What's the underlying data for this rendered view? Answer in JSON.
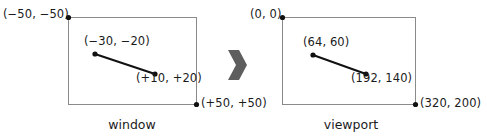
{
  "figure": {
    "colors": {
      "box_stroke": "#8a8a8a",
      "line_stroke": "#111111",
      "point_fill": "#111111",
      "arrow_fill": "#5e5e5e",
      "text": "#1b1b1b",
      "background": "#ffffff"
    }
  },
  "panels": [
    {
      "id": "window",
      "caption": "window",
      "box": {
        "x": 68,
        "y": 17,
        "w": 128,
        "h": 87
      },
      "corner_labels": {
        "top_left": "(−50, −50)",
        "bottom_right": "(+50, +50)"
      },
      "segment": {
        "start_label": "(−30, −20)",
        "end_label": "(+10, +20)",
        "start": {
          "x": 95,
          "y": 54
        },
        "end": {
          "x": 155,
          "y": 74
        }
      }
    },
    {
      "id": "viewport",
      "caption": "viewport",
      "box": {
        "x": 282,
        "y": 17,
        "w": 133,
        "h": 87
      },
      "corner_labels": {
        "top_left": "(0, 0)",
        "bottom_right": "(320, 200)"
      },
      "segment": {
        "start_label": "(64, 60)",
        "end_label": "(192, 140)",
        "start": {
          "x": 313,
          "y": 55
        },
        "end": {
          "x": 366,
          "y": 74
        }
      }
    }
  ],
  "arrow": {
    "name": "maps-to-arrow",
    "direction": "right"
  }
}
